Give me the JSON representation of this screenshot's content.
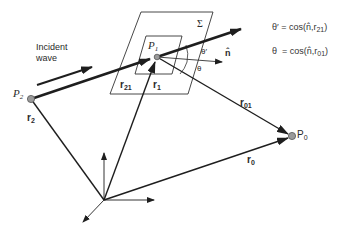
{
  "diagram": {
    "type": "vector geometry (diffraction: Huygens-Fresnel / Kirchhoff setup)",
    "colors": {
      "line": "#1e1e1e",
      "point_fill": "#9a9a9a",
      "point_stroke": "#555555",
      "background": "#ffffff"
    },
    "points": {
      "P2": {
        "label": "P",
        "sub": "2",
        "x": 31,
        "y": 99
      },
      "P1": {
        "label": "P",
        "sub": "1",
        "x": 157,
        "y": 57
      },
      "P0": {
        "label": "P",
        "sub": "0",
        "x": 292,
        "y": 136
      },
      "origin": {
        "x": 104,
        "y": 200
      }
    },
    "surface": {
      "label": "Σ"
    },
    "incident": {
      "line1": "Incident",
      "line2": "wave"
    },
    "vectors": {
      "r21": {
        "label": "r",
        "sub": "21"
      },
      "r1": {
        "label": "r",
        "sub": "1"
      },
      "r2": {
        "label": "r",
        "sub": "2"
      },
      "r01": {
        "label": "r",
        "sub": "01"
      },
      "r0": {
        "label": "r",
        "sub": "0"
      },
      "n": {
        "label": "n̂"
      }
    },
    "angles": {
      "theta_prime": "θ′",
      "theta": "θ"
    },
    "equations": [
      {
        "lhs": "θ′",
        "rhs_pre": " = cos(n̂,r",
        "sub": "21",
        "rhs_post": ")"
      },
      {
        "lhs": "θ",
        "rhs_pre": "  = cos(n̂,r",
        "sub": "01",
        "rhs_post": ")"
      }
    ]
  }
}
